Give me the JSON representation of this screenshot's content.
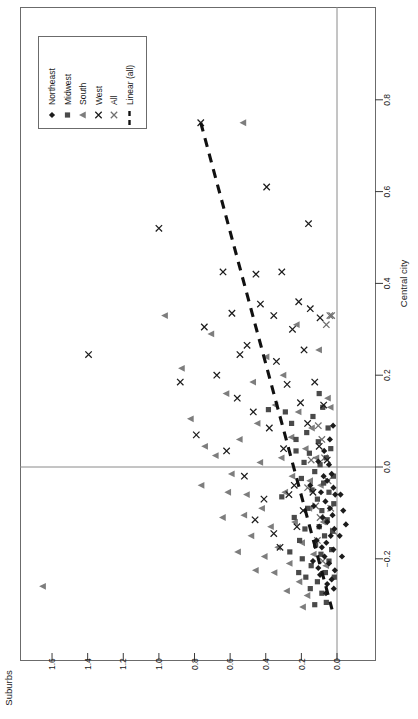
{
  "figure": {
    "orientation": "rotated-90",
    "background": "#ffffff",
    "frame_color": "#6b6b6b",
    "zero_line_color": "#8a8a8a"
  },
  "legend": {
    "border_color": "#6b6b6b",
    "entries": [
      {
        "label": "Northeast",
        "marker": "diamond",
        "color": "#1c1c1c"
      },
      {
        "label": "Midwest",
        "marker": "square",
        "color": "#4a4a4a"
      },
      {
        "label": "South",
        "marker": "triangle-left",
        "color": "#7d7d7d"
      },
      {
        "label": "West",
        "marker": "cross",
        "color": "#1c1c1c"
      },
      {
        "label": "All",
        "marker": "cross",
        "color": "#6f6f6f"
      },
      {
        "label": "Linear (all)",
        "marker": "dashed-line",
        "color": "#111111"
      }
    ]
  },
  "chart_data": {
    "type": "scatter",
    "title": "",
    "xlabel": "Suburbs",
    "ylabel": "Central city",
    "xlim": [
      -0.12,
      1.73
    ],
    "ylim": [
      -0.3,
      0.88
    ],
    "x_ticks": [
      1.6,
      1.4,
      1.2,
      1.0,
      0.8,
      0.6,
      0.4,
      0.2,
      0.0
    ],
    "y_ticks": [
      0.8,
      0.6,
      0.4,
      0.2,
      0.0,
      -0.2
    ],
    "x_axis_reversed": true,
    "grid": false,
    "zero_lines": {
      "x": 0.0,
      "y": 0.0
    },
    "legend_position": "top-left",
    "trendline": {
      "name": "Linear (all)",
      "style": "dashed",
      "color": "#111111",
      "x_start": 0.765,
      "y_start": 0.75,
      "x_end": 0.028,
      "y_end": -0.31
    },
    "series": [
      {
        "name": "Northeast",
        "marker": "diamond",
        "color": "#1c1c1c",
        "points": [
          [
            0.045,
            0.005
          ],
          [
            0.03,
            -0.015
          ],
          [
            0.055,
            -0.03
          ],
          [
            0.02,
            -0.045
          ],
          [
            0.075,
            -0.02
          ],
          [
            0.01,
            -0.06
          ],
          [
            0.065,
            -0.075
          ],
          [
            0.04,
            -0.09
          ],
          [
            0.09,
            -0.055
          ],
          [
            0.025,
            -0.105
          ],
          [
            0.055,
            -0.12
          ],
          [
            0.015,
            -0.135
          ],
          [
            0.08,
            -0.11
          ],
          [
            0.035,
            -0.15
          ],
          [
            0.06,
            -0.165
          ],
          [
            0.1,
            -0.13
          ],
          [
            0.02,
            -0.18
          ],
          [
            0.07,
            -0.195
          ],
          [
            0.045,
            -0.21
          ],
          [
            0.012,
            -0.225
          ],
          [
            0.085,
            -0.175
          ],
          [
            0.03,
            -0.245
          ],
          [
            0.055,
            -0.255
          ],
          [
            0.105,
            -0.22
          ],
          [
            0.018,
            -0.265
          ],
          [
            -0.02,
            -0.06
          ],
          [
            -0.035,
            -0.095
          ],
          [
            -0.015,
            -0.15
          ],
          [
            -0.05,
            -0.125
          ],
          [
            -0.028,
            -0.195
          ],
          [
            0.13,
            -0.085
          ],
          [
            0.15,
            -0.04
          ],
          [
            0.115,
            -0.16
          ],
          [
            0.095,
            -0.235
          ],
          [
            0.062,
            -0.275
          ],
          [
            0.04,
            0.06
          ],
          [
            0.072,
            0.035
          ],
          [
            0.022,
            0.09
          ],
          [
            0.105,
            0.012
          ],
          [
            0.135,
            -0.205
          ]
        ]
      },
      {
        "name": "Midwest",
        "marker": "square",
        "color": "#4a4a4a",
        "points": [
          [
            0.06,
            0.02
          ],
          [
            0.095,
            0.005
          ],
          [
            0.035,
            0.04
          ],
          [
            0.125,
            -0.01
          ],
          [
            0.075,
            -0.035
          ],
          [
            0.155,
            0.03
          ],
          [
            0.045,
            -0.055
          ],
          [
            0.11,
            -0.07
          ],
          [
            0.185,
            0.01
          ],
          [
            0.085,
            -0.095
          ],
          [
            0.14,
            -0.05
          ],
          [
            0.055,
            -0.115
          ],
          [
            0.2,
            -0.025
          ],
          [
            0.1,
            -0.13
          ],
          [
            0.165,
            -0.09
          ],
          [
            0.07,
            -0.15
          ],
          [
            0.23,
            0.06
          ],
          [
            0.12,
            -0.17
          ],
          [
            0.18,
            -0.135
          ],
          [
            0.09,
            -0.19
          ],
          [
            0.045,
            -0.205
          ],
          [
            0.145,
            -0.215
          ],
          [
            0.065,
            -0.23
          ],
          [
            0.21,
            -0.16
          ],
          [
            0.11,
            -0.25
          ],
          [
            0.03,
            -0.18
          ],
          [
            0.255,
            0.095
          ],
          [
            0.17,
            0.075
          ],
          [
            0.135,
            0.11
          ],
          [
            0.08,
            0.13
          ],
          [
            0.05,
            0.085
          ],
          [
            0.105,
            0.055
          ],
          [
            0.195,
            -0.2
          ],
          [
            0.15,
            -0.265
          ],
          [
            0.085,
            -0.275
          ],
          [
            0.29,
            0.12
          ],
          [
            0.24,
            -0.11
          ],
          [
            0.215,
            -0.23
          ],
          [
            0.06,
            -0.295
          ],
          [
            0.125,
            -0.3
          ],
          [
            0.02,
            -0.02
          ],
          [
            0.018,
            -0.08
          ],
          [
            0.025,
            -0.14
          ],
          [
            0.015,
            -0.24
          ],
          [
            0.385,
            0.125
          ],
          [
            0.31,
            -0.065
          ],
          [
            0.265,
            -0.185
          ],
          [
            0.175,
            -0.24
          ],
          [
            0.1,
            0.16
          ],
          [
            0.23,
            0.035
          ]
        ]
      },
      {
        "name": "South",
        "marker": "triangle-left",
        "color": "#7d7d7d",
        "points": [
          [
            1.65,
            -0.26
          ],
          [
            0.525,
            0.75
          ],
          [
            0.965,
            0.33
          ],
          [
            0.87,
            0.215
          ],
          [
            0.705,
            0.29
          ],
          [
            0.62,
            0.16
          ],
          [
            0.82,
            0.105
          ],
          [
            0.545,
            0.06
          ],
          [
            0.47,
            0.185
          ],
          [
            0.68,
            0.025
          ],
          [
            0.395,
            0.24
          ],
          [
            0.59,
            -0.015
          ],
          [
            0.445,
            0.095
          ],
          [
            0.76,
            -0.04
          ],
          [
            0.345,
            0.135
          ],
          [
            0.505,
            -0.06
          ],
          [
            0.3,
            0.2
          ],
          [
            0.42,
            -0.09
          ],
          [
            0.255,
            0.065
          ],
          [
            0.64,
            -0.11
          ],
          [
            0.37,
            -0.13
          ],
          [
            0.215,
            0.12
          ],
          [
            0.48,
            -0.15
          ],
          [
            0.29,
            -0.055
          ],
          [
            0.175,
            0.04
          ],
          [
            0.33,
            -0.175
          ],
          [
            0.235,
            -0.12
          ],
          [
            0.14,
            0.085
          ],
          [
            0.405,
            -0.195
          ],
          [
            0.195,
            -0.165
          ],
          [
            0.265,
            -0.21
          ],
          [
            0.115,
            0.02
          ],
          [
            0.155,
            -0.09
          ],
          [
            0.35,
            -0.23
          ],
          [
            0.21,
            -0.25
          ],
          [
            0.09,
            -0.04
          ],
          [
            0.28,
            -0.27
          ],
          [
            0.13,
            -0.19
          ],
          [
            0.165,
            -0.28
          ],
          [
            0.075,
            -0.12
          ],
          [
            0.555,
            -0.185
          ],
          [
            0.455,
            -0.225
          ],
          [
            0.61,
            -0.055
          ],
          [
            0.74,
            0.045
          ],
          [
            0.05,
            0.15
          ],
          [
            0.1,
            0.255
          ],
          [
            0.225,
            0.31
          ],
          [
            0.035,
            0.13
          ],
          [
            0.06,
            -0.215
          ],
          [
            0.19,
            -0.305
          ],
          [
            0.31,
            0.02
          ],
          [
            0.25,
            -0.02
          ],
          [
            0.43,
            0.01
          ],
          [
            0.15,
            -0.03
          ],
          [
            0.52,
            -0.105
          ]
        ]
      },
      {
        "name": "West",
        "marker": "cross",
        "color": "#1c1c1c",
        "points": [
          [
            0.765,
            0.75
          ],
          [
            1.395,
            0.245
          ],
          [
            1.0,
            0.52
          ],
          [
            0.64,
            0.425
          ],
          [
            0.455,
            0.42
          ],
          [
            0.59,
            0.335
          ],
          [
            0.395,
            0.61
          ],
          [
            0.16,
            0.53
          ],
          [
            0.745,
            0.305
          ],
          [
            0.31,
            0.425
          ],
          [
            0.215,
            0.36
          ],
          [
            0.88,
            0.185
          ],
          [
            0.505,
            0.265
          ],
          [
            0.355,
            0.33
          ],
          [
            0.675,
            0.2
          ],
          [
            0.43,
            0.355
          ],
          [
            0.25,
            0.3
          ],
          [
            0.15,
            0.345
          ],
          [
            0.56,
            0.15
          ],
          [
            0.34,
            0.23
          ],
          [
            0.185,
            0.255
          ],
          [
            0.79,
            0.07
          ],
          [
            0.47,
            0.12
          ],
          [
            0.28,
            0.18
          ],
          [
            0.095,
            0.325
          ],
          [
            0.62,
            0.035
          ],
          [
            0.38,
            0.085
          ],
          [
            0.205,
            0.14
          ],
          [
            0.125,
            0.185
          ],
          [
            0.52,
            -0.02
          ],
          [
            0.3,
            0.04
          ],
          [
            0.165,
            0.095
          ],
          [
            0.24,
            -0.04
          ],
          [
            0.075,
            0.135
          ],
          [
            0.41,
            -0.07
          ],
          [
            0.545,
            0.245
          ],
          [
            0.46,
            -0.115
          ],
          [
            0.355,
            -0.145
          ],
          [
            0.27,
            -0.06
          ],
          [
            0.19,
            -0.095
          ],
          [
            0.1,
            0.045
          ],
          [
            0.32,
            -0.175
          ],
          [
            0.225,
            -0.13
          ],
          [
            0.135,
            -0.055
          ],
          [
            0.055,
            0.015
          ]
        ]
      },
      {
        "name": "All",
        "marker": "cross",
        "color": "#6f6f6f",
        "points": [
          [
            0.06,
            0.31
          ],
          [
            0.04,
            0.33
          ],
          [
            0.03,
            0.33
          ],
          [
            0.105,
            0.09
          ],
          [
            0.085,
            0.06
          ],
          [
            0.07,
            0.02
          ],
          [
            0.05,
            -0.03
          ],
          [
            0.12,
            -0.085
          ],
          [
            0.095,
            -0.11
          ],
          [
            0.145,
            0.015
          ],
          [
            0.035,
            -0.09
          ],
          [
            0.02,
            -0.14
          ],
          [
            0.165,
            -0.045
          ],
          [
            0.11,
            -0.16
          ],
          [
            0.08,
            -0.205
          ]
        ]
      }
    ]
  }
}
